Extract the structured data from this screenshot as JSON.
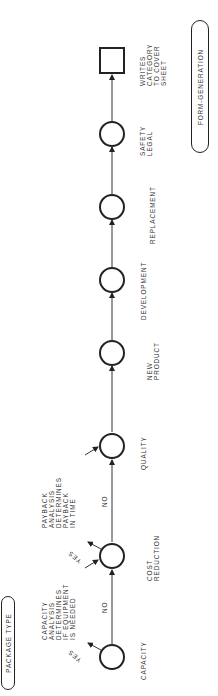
{
  "diagram": {
    "start_label": "PACKAGE TYPE",
    "end_label": "FORM-GENERATION",
    "nodes": [
      {
        "label": "CAPACITY"
      },
      {
        "label": "COST\nREDUCTION"
      },
      {
        "label": "QUALITY"
      },
      {
        "label": "NEW\nPRODUCT"
      },
      {
        "label": "DEVELOPMENT"
      },
      {
        "label": "REPLACEMENT"
      },
      {
        "label": "SAFETY\nLEGAL"
      },
      {
        "label": "WRITES\nCATEGORY\nTO COVER\nSHEET"
      }
    ],
    "edges": [
      {
        "label": "NO"
      },
      {
        "label": "NO"
      }
    ],
    "branches": [
      {
        "label": "YES"
      },
      {
        "label": "YES"
      }
    ],
    "notes": [
      {
        "text": "CAPACITY\nANALYSIS\nDETERMINES\nIF EQUIPMENT\nIS NEEDED"
      },
      {
        "text": "PAYBACK\nANALYSIS\nDETERMINES\nPAYBACK\nIN TIME"
      }
    ]
  }
}
